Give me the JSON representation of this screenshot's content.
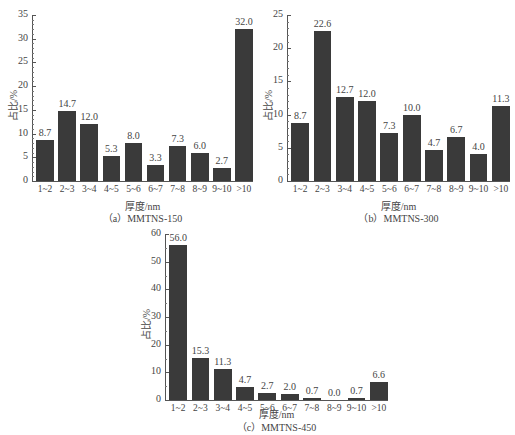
{
  "chart_data": [
    {
      "type": "bar",
      "title": "(a) MMTNS-150",
      "caption": "（a）MMTNS-150",
      "xlabel": "厚度/nm",
      "ylabel": "占比/%",
      "categories": [
        "1~2",
        "2~3",
        "3~4",
        "4~5",
        "5~6",
        "6~7",
        "7~8",
        "8~9",
        "9~10",
        ">10"
      ],
      "values": [
        8.7,
        14.7,
        12.0,
        5.3,
        8.0,
        3.3,
        7.3,
        6.0,
        2.7,
        32.0
      ],
      "value_labels": [
        "8.7",
        "14.7",
        "12.0",
        "5.3",
        "8.0",
        "3.3",
        "7.3",
        "6.0",
        "2.7",
        "32.0"
      ],
      "ylim": [
        0,
        35
      ],
      "yticks": [
        0,
        5,
        10,
        15,
        20,
        25,
        30,
        35
      ],
      "grid": false,
      "legend": null
    },
    {
      "type": "bar",
      "title": "(b) MMTNS-300",
      "caption": "（b）MMTNS-300",
      "xlabel": "厚度/nm",
      "ylabel": "占比/%",
      "categories": [
        "1~2",
        "2~3",
        "3~4",
        "4~5",
        "5~6",
        "6~7",
        "7~8",
        "8~9",
        "9~10",
        ">10"
      ],
      "values": [
        8.7,
        22.6,
        12.7,
        12.0,
        7.3,
        10.0,
        4.7,
        6.7,
        4.0,
        11.3
      ],
      "value_labels": [
        "8.7",
        "22.6",
        "12.7",
        "12.0",
        "7.3",
        "10.0",
        "4.7",
        "6.7",
        "4.0",
        "11.3"
      ],
      "ylim": [
        0,
        25
      ],
      "yticks": [
        0,
        5,
        10,
        15,
        20,
        25
      ],
      "grid": false,
      "legend": null
    },
    {
      "type": "bar",
      "title": "(c) MMTNS-450",
      "caption": "（c）MMTNS-450",
      "xlabel": "厚度/nm",
      "ylabel": "占比/%",
      "categories": [
        "1~2",
        "2~3",
        "3~4",
        "4~5",
        "5~6",
        "6~7",
        "7~8",
        "8~9",
        "9~10",
        ">10"
      ],
      "values": [
        56.0,
        15.3,
        11.3,
        4.7,
        2.7,
        2.0,
        0.7,
        0.0,
        0.7,
        6.6
      ],
      "value_labels": [
        "56.0",
        "15.3",
        "11.3",
        "4.7",
        "2.7",
        "2.0",
        "0.7",
        "0.0",
        "0.7",
        "6.6"
      ],
      "ylim": [
        0,
        60
      ],
      "yticks": [
        0,
        10,
        20,
        30,
        40,
        50,
        60
      ],
      "grid": false,
      "legend": null
    }
  ],
  "colors": {
    "bar": "#3a3a3a",
    "axis": "#555555",
    "text": "#444444",
    "background": "#ffffff"
  }
}
